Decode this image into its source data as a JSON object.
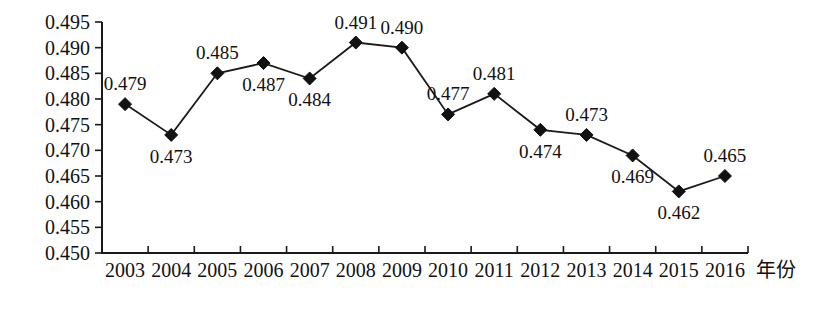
{
  "chart_data": {
    "type": "line",
    "title": "",
    "xlabel": "年份",
    "ylabel": "",
    "categories": [
      "2003",
      "2004",
      "2005",
      "2006",
      "2007",
      "2008",
      "2009",
      "2010",
      "2011",
      "2012",
      "2013",
      "2014",
      "2015",
      "2016"
    ],
    "values": [
      0.479,
      0.473,
      0.485,
      0.487,
      0.484,
      0.491,
      0.49,
      0.477,
      0.481,
      0.474,
      0.473,
      0.469,
      0.462,
      0.465
    ],
    "point_labels": [
      "0.479",
      "0.473",
      "0.485",
      "0.487",
      "0.484",
      "0.491",
      "0.490",
      "0.477",
      "0.481",
      "0.474",
      "0.473",
      "0.469",
      "0.462",
      "0.465"
    ],
    "label_positions": [
      "above",
      "below",
      "above",
      "below",
      "below",
      "above",
      "above",
      "above",
      "above",
      "below",
      "above",
      "below",
      "below",
      "above"
    ],
    "ylim": [
      0.45,
      0.495
    ],
    "ytick_labels": [
      "0.495",
      "0.490",
      "0.485",
      "0.480",
      "0.475",
      "0.470",
      "0.465",
      "0.460",
      "0.455",
      "0.450"
    ],
    "ytick_values": [
      0.495,
      0.49,
      0.485,
      0.48,
      0.475,
      0.47,
      0.465,
      0.46,
      0.455,
      0.45
    ],
    "grid": false,
    "legend": "none",
    "marker": "diamond",
    "line_color": "#1a1a1a",
    "marker_color": "#111111"
  }
}
